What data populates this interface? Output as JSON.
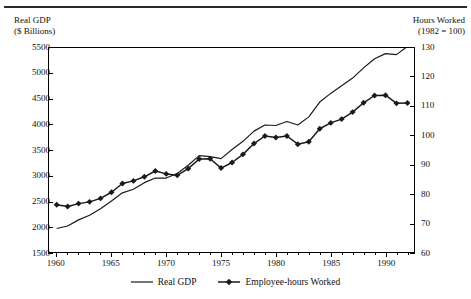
{
  "header": {
    "left_axis_title": "Real GDP\n($ Billions)",
    "right_axis_title": "Hours Worked\n(1982 = 100)"
  },
  "legend": {
    "items": [
      {
        "label": "Real GDP",
        "marker": "line",
        "color": "#1a1a1a"
      },
      {
        "label": "Employee-hours Worked",
        "marker": "line-diamond",
        "color": "#1a1a1a"
      }
    ]
  },
  "chart_data": {
    "type": "line",
    "title": "",
    "xlabel": "",
    "grid": false,
    "legend_position": "bottom-center",
    "x": [
      1960,
      1961,
      1962,
      1963,
      1964,
      1965,
      1966,
      1967,
      1968,
      1969,
      1970,
      1971,
      1972,
      1973,
      1974,
      1975,
      1976,
      1977,
      1978,
      1979,
      1980,
      1981,
      1982,
      1983,
      1984,
      1985,
      1986,
      1987,
      1988,
      1989,
      1990,
      1991,
      1992
    ],
    "xlim": [
      1959.3,
      1992.6
    ],
    "xticks": [
      1960,
      1965,
      1970,
      1975,
      1980,
      1985,
      1990
    ],
    "xticklabels": [
      "1960",
      "1965",
      "1970",
      "1975",
      "1980",
      "1985",
      "1990"
    ],
    "axes": [
      {
        "id": "left",
        "label": "Real GDP ($ Billions)",
        "ylim": [
          1500,
          5500
        ],
        "yticks": [
          1500,
          2000,
          2500,
          3000,
          3500,
          4000,
          4500,
          5000,
          5500
        ],
        "yticklabels": [
          "1500",
          "2000",
          "2500",
          "3000",
          "3500",
          "4000",
          "4500",
          "5000",
          "5500"
        ]
      },
      {
        "id": "right",
        "label": "Hours Worked (1982 = 100)",
        "ylim": [
          60,
          130
        ],
        "yticks": [
          60,
          70,
          80,
          90,
          100,
          110,
          120,
          130
        ],
        "yticklabels": [
          "60",
          "70",
          "80",
          "90",
          "100",
          "110",
          "120",
          "130"
        ]
      }
    ],
    "series": [
      {
        "name": "Real GDP",
        "axis": "left",
        "units": "$ Billions",
        "marker": "none",
        "color": "#1a1a1a",
        "values": [
          1960,
          2010,
          2130,
          2220,
          2350,
          2500,
          2660,
          2730,
          2860,
          2950,
          2950,
          3040,
          3200,
          3390,
          3370,
          3330,
          3510,
          3670,
          3870,
          3990,
          3980,
          4060,
          3990,
          4150,
          4440,
          4610,
          4760,
          4910,
          5110,
          5290,
          5390,
          5370,
          5530
        ]
      },
      {
        "name": "Employee-hours Worked",
        "axis": "right",
        "units": "Index 1982 = 100",
        "marker": "diamond",
        "color": "#1a1a1a",
        "values": [
          76.2,
          75.6,
          76.6,
          77.2,
          78.4,
          80.5,
          83.5,
          84.4,
          85.8,
          87.8,
          86.8,
          86.3,
          88.6,
          91.9,
          92.0,
          88.8,
          90.7,
          93.5,
          97.2,
          99.8,
          99.3,
          99.8,
          97.0,
          97.8,
          102.3,
          104.3,
          105.6,
          108.0,
          111.2,
          113.7,
          113.8,
          111.0,
          111.1
        ]
      }
    ]
  }
}
